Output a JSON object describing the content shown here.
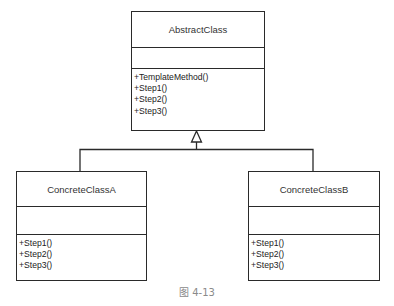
{
  "diagram": {
    "type": "uml-class-diagram",
    "classes": [
      {
        "id": "abstract",
        "name": "AbstractClass",
        "attributes": [],
        "operations": [
          "+TemplateMethod()",
          "+Step1()",
          "+Step2()",
          "+Step3()"
        ]
      },
      {
        "id": "concrete_a",
        "name": "ConcreteClassA",
        "attributes": [],
        "operations": [
          "+Step1()",
          "+Step2()",
          "+Step3()"
        ]
      },
      {
        "id": "concrete_b",
        "name": "ConcreteClassB",
        "attributes": [],
        "operations": [
          "+Step1()",
          "+Step2()",
          "+Step3()"
        ]
      }
    ],
    "relationships": [
      {
        "type": "generalization",
        "from": "ConcreteClassA",
        "to": "AbstractClass"
      },
      {
        "type": "generalization",
        "from": "ConcreteClassB",
        "to": "AbstractClass"
      }
    ]
  },
  "caption": "图 4-13",
  "colors": {
    "line": "#2a2a2a",
    "caption": "#8a8a8a",
    "background": "#ffffff"
  }
}
